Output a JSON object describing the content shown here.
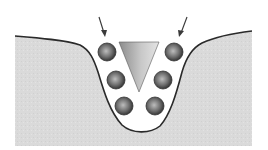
{
  "diagram": {
    "type": "cross-section illustration",
    "colors": {
      "background": "#ffffff",
      "ground_fill": "#dcdcdc",
      "ground_outline": "#2a2a2a",
      "wedge_light": "#9a9a9a",
      "wedge_dark": "#d8d8d8",
      "sphere_center": "#b5b5b5",
      "sphere_edge": "#3a3a3a",
      "arrow": "#3a3a3a"
    },
    "elements": {
      "arrows": [
        {
          "name": "left-arrow",
          "from": [
            99,
            17
          ],
          "to": [
            105,
            36
          ]
        },
        {
          "name": "right-arrow",
          "from": [
            186,
            17
          ],
          "to": [
            179,
            36
          ]
        }
      ],
      "wedge": {
        "points": [
          [
            119,
            42
          ],
          [
            159,
            42
          ],
          [
            139,
            92
          ]
        ]
      },
      "spheres": [
        {
          "cx": 107,
          "cy": 52,
          "r": 9
        },
        {
          "cx": 174,
          "cy": 52,
          "r": 9
        },
        {
          "cx": 116,
          "cy": 80,
          "r": 9
        },
        {
          "cx": 163,
          "cy": 80,
          "r": 9
        },
        {
          "cx": 124,
          "cy": 106,
          "r": 9
        },
        {
          "cx": 155,
          "cy": 106,
          "r": 9
        }
      ]
    }
  }
}
